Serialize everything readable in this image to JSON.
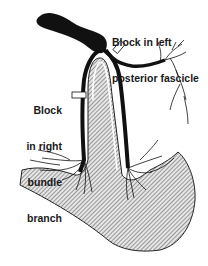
{
  "diagram": {
    "labels": [
      {
        "id": "left-posterior-fascicle-block",
        "line1": "Block in left",
        "line2": "posterior fascicle"
      },
      {
        "id": "right-bundle-branch-block",
        "line1": "Block",
        "line2": "in right",
        "line3": "bundle",
        "line4": "branch"
      }
    ],
    "colors": {
      "conduction_path": "#111111",
      "myocardium_hatch": "#8a8a8a",
      "background": "#ffffff",
      "block_marker": "#ffffff"
    }
  }
}
